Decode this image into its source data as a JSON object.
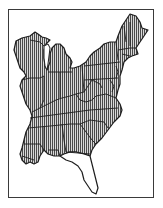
{
  "map": {
    "title": "",
    "type": "range-map",
    "region": "Eastern United States",
    "colors": {
      "background": "#ffffff",
      "frame": "#3a3a3a",
      "outline": "#1e1e1e",
      "hatch": "#4a4a4a",
      "hatch_gap": "#d8d8d8",
      "unhatched_fill": "#ffffff"
    },
    "legend": {
      "hatched": "range",
      "unhatched": "outside range"
    },
    "regions": [
      {
        "name": "Wisconsin",
        "hatched": true
      },
      {
        "name": "Michigan",
        "hatched": true
      },
      {
        "name": "Illinois",
        "hatched": true
      },
      {
        "name": "Indiana",
        "hatched": true
      },
      {
        "name": "Ohio",
        "hatched": true
      },
      {
        "name": "Kentucky",
        "hatched": true
      },
      {
        "name": "Tennessee",
        "hatched": true
      },
      {
        "name": "Mississippi",
        "hatched": true
      },
      {
        "name": "Alabama",
        "hatched": true
      },
      {
        "name": "Georgia",
        "hatched": true
      },
      {
        "name": "South Carolina",
        "hatched": true
      },
      {
        "name": "North Carolina",
        "hatched": true
      },
      {
        "name": "Virginia",
        "hatched": true
      },
      {
        "name": "West Virginia",
        "hatched": true
      },
      {
        "name": "Pennsylvania",
        "hatched": true
      },
      {
        "name": "New York",
        "hatched": true
      },
      {
        "name": "New England",
        "hatched": true
      },
      {
        "name": "Maine",
        "hatched": true
      },
      {
        "name": "Maryland / Delaware / New Jersey",
        "hatched": true
      },
      {
        "name": "Louisiana (east)",
        "hatched": true
      },
      {
        "name": "Florida peninsula",
        "hatched": false
      }
    ]
  }
}
